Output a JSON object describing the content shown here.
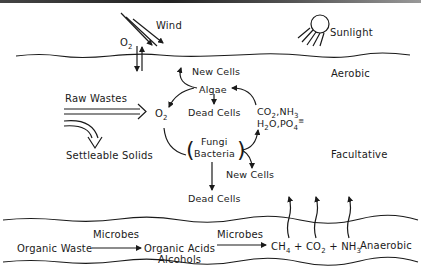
{
  "diagram": {
    "zones": {
      "aerobic": "Aerobic",
      "facultative": "Facultative",
      "anaerobic": "Anaerobic"
    },
    "surface": {
      "wind": "Wind",
      "sunlight": "Sunlight",
      "oxygen_exchange": "O",
      "oxygen_sub": "2"
    },
    "inputs": {
      "raw_wastes": "Raw Wastes",
      "settleable_solids": "Settleable Solids"
    },
    "cycle": {
      "oxygen": "O",
      "oxygen_sub": "2",
      "algae": "Algae",
      "algae_new_cells": "New Cells",
      "algae_dead_cells": "Dead Cells",
      "fungi": "Fungi",
      "bacteria": "Bacteria",
      "bacteria_new_cells": "New Cells",
      "bacteria_dead_cells": "Dead Cells",
      "nutrients_line1": "CO2,NH3",
      "nutrients_line2": "H2O,PO4≡"
    },
    "anaerobic_process": {
      "organic_waste": "Organic Waste",
      "microbes_1": "Microbes",
      "organic_acids": "Organic Acids",
      "alcohols": "Alcohols",
      "microbes_2": "Microbes",
      "gases": "CH4 + CO2 + NH3"
    },
    "colors": {
      "ink": "#1a1a1a",
      "background": "#ffffff"
    }
  }
}
